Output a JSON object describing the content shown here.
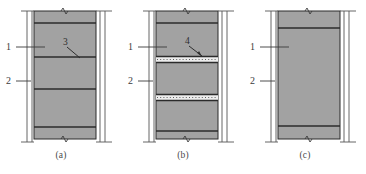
{
  "figure": {
    "background_color": "#ffffff",
    "wall_fill_color": "#a2a2a2",
    "line_color": "#2b2b2b",
    "joint_band_color": "#e8e8e8",
    "label_color": "#3c3c3c"
  },
  "panels": [
    {
      "id": "a",
      "caption": "(a)",
      "reference_labels": [
        {
          "text": "1",
          "target": "wall-panel"
        },
        {
          "text": "2",
          "target": "side-column"
        }
      ],
      "callouts": [
        {
          "text": "3",
          "target": "solid-mortar-joint"
        }
      ],
      "joint_type": "solid",
      "joint_count": 4,
      "joint_positions_pct": [
        9,
        36,
        61,
        88
      ],
      "break_marks": [
        "top",
        "bottom"
      ]
    },
    {
      "id": "b",
      "caption": "(b)",
      "reference_labels": [
        {
          "text": "1",
          "target": "wall-panel"
        },
        {
          "text": "2",
          "target": "side-column"
        }
      ],
      "callouts": [
        {
          "text": "4",
          "target": "dotted-filled-joint"
        }
      ],
      "joint_type": "mixed",
      "joint_count": 4,
      "joint_positions_pct": [
        9,
        39,
        67,
        91
      ],
      "break_marks": [
        "top",
        "bottom"
      ]
    },
    {
      "id": "c",
      "caption": "(c)",
      "reference_labels": [
        {
          "text": "1",
          "target": "wall-panel"
        },
        {
          "text": "2",
          "target": "side-column"
        }
      ],
      "callouts": [],
      "joint_type": "solid",
      "joint_count": 2,
      "joint_positions_pct": [
        13,
        88
      ],
      "break_marks": [
        "top",
        "bottom"
      ]
    }
  ]
}
